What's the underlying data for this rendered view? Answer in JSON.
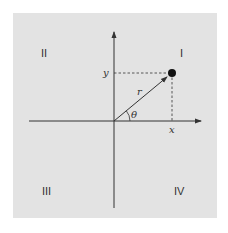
{
  "diagram": {
    "title": "",
    "quadrants": {
      "q1": "I",
      "q2": "II",
      "q3": "III",
      "q4": "IV"
    },
    "labels": {
      "x": "x",
      "y": "y",
      "r": "r",
      "theta": "θ"
    },
    "colors": {
      "background": "#e3e3e3",
      "ink": "#333333"
    }
  }
}
